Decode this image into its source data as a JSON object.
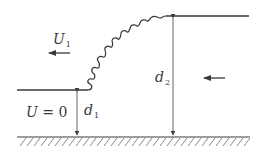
{
  "diagram": {
    "labels": {
      "upstream_velocity": {
        "symbol": "U",
        "subscript": "1"
      },
      "still_water": {
        "symbol": "U",
        "relation": "= 0"
      },
      "depth_low": {
        "symbol": "d",
        "subscript": "1"
      },
      "depth_high": {
        "symbol": "d",
        "subscript": "2"
      }
    },
    "arrows": [
      {
        "name": "u1-direction",
        "direction": "left"
      },
      {
        "name": "bore-direction",
        "direction": "left"
      }
    ],
    "colors": {
      "line": "#3a3a3a",
      "hatch": "#6a6a6a",
      "background": "#ffffff"
    }
  }
}
